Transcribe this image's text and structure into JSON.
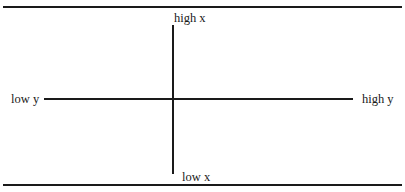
{
  "diagram": {
    "type": "quadrant-axes",
    "vertical_axis": {
      "top_label": "high x",
      "bottom_label": "low x"
    },
    "horizontal_axis": {
      "left_label": "low y",
      "right_label": "high y"
    },
    "line_color": "#1a1a1a"
  }
}
